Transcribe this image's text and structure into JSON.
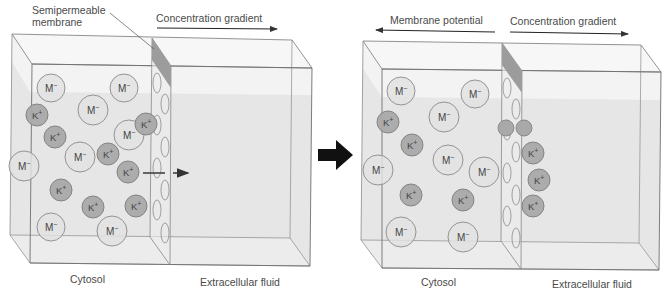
{
  "colors": {
    "background": "#ffffff",
    "fluid": "#e4e4e4",
    "fluid_top": "#f1f1f1",
    "edge": "#7a7a7a",
    "membrane_shade": "#9c9c9c",
    "anion_fill": "#e2e2e2",
    "anion_stroke": "#8a8a8a",
    "cation_fill": "#a9a9a9",
    "cation_stroke": "#7d7d7d",
    "text": "#4a4a4a",
    "arrow": "#333333",
    "big_arrow": "#111111"
  },
  "labels": {
    "semipermeable_line1": "Semipermeable",
    "semipermeable_line2": "membrane",
    "left_concentration_gradient": "Concentration gradient",
    "right_membrane_potential": "Membrane potential",
    "right_concentration_gradient": "Concentration gradient",
    "left_cytosol": "Cytosol",
    "left_extracellular": "Extracellular fluid",
    "right_cytosol": "Cytosol",
    "right_extracellular": "Extracellular fluid"
  },
  "ion_labels": {
    "anion": "M−",
    "cation": "K+"
  },
  "panels": [
    {
      "id": "before",
      "anions": [
        {
          "x": 51,
          "y": 88,
          "r": 14
        },
        {
          "x": 124,
          "y": 88,
          "r": 14
        },
        {
          "x": 93,
          "y": 110,
          "r": 15
        },
        {
          "x": 129,
          "y": 135,
          "r": 15
        },
        {
          "x": 80,
          "y": 157,
          "r": 15
        },
        {
          "x": 24,
          "y": 166,
          "r": 15
        },
        {
          "x": 51,
          "y": 227,
          "r": 14
        },
        {
          "x": 112,
          "y": 231,
          "r": 15
        }
      ],
      "cations": [
        {
          "x": 37,
          "y": 115,
          "r": 11
        },
        {
          "x": 55,
          "y": 137,
          "r": 11
        },
        {
          "x": 146,
          "y": 124,
          "r": 11
        },
        {
          "x": 108,
          "y": 154,
          "r": 11
        },
        {
          "x": 128,
          "y": 172,
          "r": 11
        },
        {
          "x": 61,
          "y": 190,
          "r": 11
        },
        {
          "x": 93,
          "y": 207,
          "r": 11
        },
        {
          "x": 136,
          "y": 206,
          "r": 11
        }
      ]
    },
    {
      "id": "after",
      "anions": [
        {
          "x": 401,
          "y": 91,
          "r": 14
        },
        {
          "x": 475,
          "y": 94,
          "r": 14
        },
        {
          "x": 444,
          "y": 117,
          "r": 15
        },
        {
          "x": 448,
          "y": 160,
          "r": 15
        },
        {
          "x": 378,
          "y": 170,
          "r": 15
        },
        {
          "x": 484,
          "y": 172,
          "r": 15
        },
        {
          "x": 401,
          "y": 232,
          "r": 15
        },
        {
          "x": 463,
          "y": 237,
          "r": 15
        }
      ],
      "cations": [
        {
          "x": 388,
          "y": 122,
          "r": 11
        },
        {
          "x": 412,
          "y": 145,
          "r": 11
        },
        {
          "x": 411,
          "y": 195,
          "r": 11
        },
        {
          "x": 463,
          "y": 200,
          "r": 11
        },
        {
          "x": 533,
          "y": 153,
          "r": 11
        },
        {
          "x": 539,
          "y": 180,
          "r": 11
        },
        {
          "x": 533,
          "y": 206,
          "r": 11
        }
      ],
      "half_cations_in_pores": [
        {
          "x": 506,
          "y": 128,
          "r": 8
        },
        {
          "x": 524,
          "y": 128,
          "r": 8
        }
      ]
    }
  ]
}
